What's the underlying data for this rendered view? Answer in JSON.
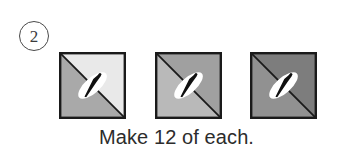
{
  "page": {
    "background_color": "#ffffff",
    "width": 353,
    "height": 157
  },
  "step": {
    "number": "2",
    "badge_shape": "circle",
    "badge_border_color": "#4a4a4a",
    "text_color": "#3b3b3b"
  },
  "caption": {
    "text": "Make 12 of each.",
    "color": "#2c2c2c"
  },
  "diagram": {
    "type": "quilt-block-units",
    "unit_count": 3,
    "unit_shape": "square half-square-triangle with pin",
    "border_color": "#1a1a1a",
    "diagonal_color": "#1a1a1a",
    "pin_color": "#101010",
    "pin_halo_color": "#ffffff",
    "units": [
      {
        "name": "unit-1",
        "lower_left_fill": "#a9a9a9",
        "upper_right_fill": "#e9e9e9",
        "diagonal": "top-left-to-bottom-right",
        "pin_orientation": "bottom-left-to-top-right"
      },
      {
        "name": "unit-2",
        "lower_left_fill": "#b9b9b9",
        "upper_right_fill": "#a0a0a0",
        "diagonal": "top-left-to-bottom-right",
        "pin_orientation": "bottom-left-to-top-right"
      },
      {
        "name": "unit-3",
        "lower_left_fill": "#919191",
        "upper_right_fill": "#7d7d7d",
        "diagonal": "top-left-to-bottom-right",
        "pin_orientation": "bottom-left-to-top-right"
      }
    ]
  }
}
